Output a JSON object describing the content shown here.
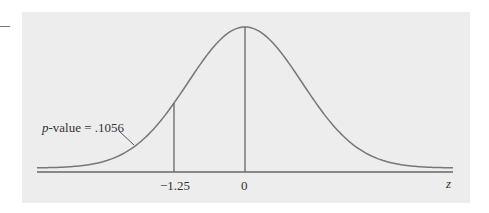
{
  "chart_data": {
    "type": "line",
    "title": "",
    "xlabel": "z",
    "ylabel": "",
    "x_ticks": [
      {
        "value": -1.25,
        "label": "-1.25"
      },
      {
        "value": 0,
        "label": "0"
      }
    ],
    "xlim": [
      -3,
      3
    ],
    "curve": "standard normal density",
    "vertical_lines": [
      -1.25,
      0
    ],
    "annotation": {
      "text_italic": "p",
      "text_rest": "-value = .1056",
      "points_to": "left tail area below z = -1.25"
    },
    "p_value": 0.1056,
    "test_statistic": -1.25,
    "grid": false,
    "legend": null,
    "colors": {
      "panel": "#ededed",
      "curve": "#777777",
      "axis": "#666666"
    }
  }
}
